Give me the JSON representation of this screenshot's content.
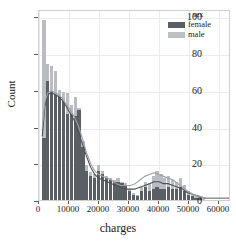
{
  "chart_data": {
    "type": "bar",
    "title": "",
    "subtitle": "",
    "xlabel": "charges",
    "ylabel": "Count",
    "xlim": [
      0,
      64000
    ],
    "ylim": [
      0,
      104
    ],
    "grid": true,
    "legend_position": "upper right",
    "legend_title": "sex",
    "xticks": [
      0,
      10000,
      20000,
      30000,
      40000,
      50000,
      60000
    ],
    "xtick_labels": [
      "0",
      "10000",
      "20000",
      "30000",
      "40000",
      "50000",
      "60000"
    ],
    "yticks": [
      0,
      20,
      40,
      60,
      80,
      100
    ],
    "ytick_labels": [
      "0",
      "20",
      "40",
      "60",
      "80",
      "100"
    ],
    "bin_width": 1300,
    "bin_starts": [
      1100,
      2400,
      3700,
      5000,
      6300,
      7600,
      8900,
      10200,
      11500,
      12800,
      14100,
      15400,
      16700,
      18000,
      19300,
      20600,
      21900,
      23200,
      24500,
      25800,
      27100,
      28400,
      29700,
      31000,
      32300,
      33600,
      34900,
      36200,
      37500,
      38800,
      40100,
      41400,
      42700,
      44000,
      45300,
      46600,
      47900,
      49200,
      50500,
      51800,
      53100,
      54400,
      55700,
      57000,
      58300,
      59600,
      60900,
      62200
    ],
    "series": [
      {
        "name": "female",
        "color": "#5a5f66",
        "values": [
          34,
          65,
          59,
          57,
          56,
          54,
          47,
          47,
          46,
          49,
          29,
          16,
          13,
          12,
          16,
          14,
          12,
          11,
          10,
          10,
          9,
          8,
          5,
          3,
          2,
          5,
          7,
          5,
          6,
          7,
          6,
          6,
          7,
          6,
          6,
          7,
          5,
          3,
          2,
          1,
          1,
          0,
          0,
          0,
          0,
          0,
          0,
          0
        ]
      },
      {
        "name": "male",
        "color": "#b9bcc0",
        "values": [
          98,
          74,
          73,
          70,
          60,
          59,
          58,
          52,
          56,
          50,
          32,
          19,
          15,
          14,
          19,
          16,
          13,
          12,
          11,
          12,
          10,
          9,
          6,
          4,
          3,
          7,
          10,
          9,
          13,
          16,
          14,
          12,
          13,
          11,
          10,
          12,
          8,
          5,
          3,
          2,
          1,
          1,
          0,
          0,
          0,
          0,
          0,
          0
        ]
      }
    ],
    "kde_curves": [
      {
        "name": "female",
        "color": "#4a4f56",
        "points": [
          [
            1100,
            35
          ],
          [
            2000,
            52
          ],
          [
            3000,
            58
          ],
          [
            4200,
            59
          ],
          [
            5400,
            58
          ],
          [
            6600,
            57
          ],
          [
            7800,
            55
          ],
          [
            9000,
            52
          ],
          [
            10400,
            48
          ],
          [
            11800,
            44
          ],
          [
            13200,
            38
          ],
          [
            14600,
            31
          ],
          [
            16000,
            24
          ],
          [
            17400,
            18
          ],
          [
            18800,
            14
          ],
          [
            20200,
            12
          ],
          [
            21600,
            11
          ],
          [
            23000,
            10
          ],
          [
            24400,
            9
          ],
          [
            26000,
            8
          ],
          [
            27600,
            7
          ],
          [
            29200,
            6
          ],
          [
            30800,
            6
          ],
          [
            32400,
            6
          ],
          [
            34000,
            7
          ],
          [
            35600,
            8
          ],
          [
            37200,
            9
          ],
          [
            38800,
            10
          ],
          [
            40400,
            10
          ],
          [
            42000,
            9
          ],
          [
            43600,
            9
          ],
          [
            45200,
            8
          ],
          [
            46800,
            7
          ],
          [
            48400,
            6
          ],
          [
            50000,
            4
          ],
          [
            52000,
            3
          ],
          [
            54000,
            2
          ],
          [
            56000,
            1
          ],
          [
            58000,
            1
          ],
          [
            60000,
            1
          ],
          [
            62000,
            1
          ],
          [
            64000,
            1
          ]
        ]
      },
      {
        "name": "male",
        "color": "#9b9fa4",
        "points": [
          [
            1100,
            40
          ],
          [
            2000,
            54
          ],
          [
            3000,
            59
          ],
          [
            4200,
            60
          ],
          [
            5400,
            59
          ],
          [
            6600,
            58
          ],
          [
            7800,
            56
          ],
          [
            9000,
            53
          ],
          [
            10400,
            50
          ],
          [
            11800,
            46
          ],
          [
            13200,
            41
          ],
          [
            14600,
            34
          ],
          [
            16000,
            26
          ],
          [
            17400,
            20
          ],
          [
            18800,
            16
          ],
          [
            20200,
            14
          ],
          [
            21600,
            13
          ],
          [
            23000,
            12
          ],
          [
            24400,
            11
          ],
          [
            26000,
            9
          ],
          [
            27600,
            8
          ],
          [
            29200,
            8
          ],
          [
            30800,
            8
          ],
          [
            32400,
            9
          ],
          [
            34000,
            11
          ],
          [
            35600,
            13
          ],
          [
            37200,
            14
          ],
          [
            38800,
            15
          ],
          [
            40400,
            14
          ],
          [
            42000,
            13
          ],
          [
            43600,
            12
          ],
          [
            45200,
            11
          ],
          [
            46800,
            9
          ],
          [
            48400,
            7
          ],
          [
            50000,
            5
          ],
          [
            52000,
            3
          ],
          [
            54000,
            2
          ],
          [
            56000,
            1
          ],
          [
            58000,
            1
          ],
          [
            60000,
            1
          ],
          [
            62000,
            1
          ],
          [
            64000,
            1
          ]
        ]
      }
    ],
    "legend_entries": [
      {
        "label": "female",
        "color": "#5a5f66"
      },
      {
        "label": "male",
        "color": "#bcbfc3"
      }
    ]
  },
  "axes": {
    "xlabel": "charges",
    "ylabel": "Count"
  },
  "legend": {
    "title": "sex",
    "female_label": "female",
    "male_label": "male"
  }
}
